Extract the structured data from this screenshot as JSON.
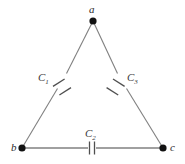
{
  "figure": {
    "type": "circuit-diagram",
    "background_color": "#ffffff",
    "wire_color": "#808080",
    "node_color": "#111111",
    "plate_color": "#5a5a5a",
    "label_color": "#2b2b2b"
  },
  "nodes": [
    {
      "id": "a",
      "label": "a",
      "x": 93,
      "y": 21
    },
    {
      "id": "b",
      "label": "b",
      "x": 22,
      "y": 148
    },
    {
      "id": "c",
      "label": "c",
      "x": 163,
      "y": 148
    }
  ],
  "components": [
    {
      "id": "C1",
      "label": "C",
      "subscript": "1",
      "edge": "b-a",
      "x": 62,
      "y": 82
    },
    {
      "id": "C2",
      "label": "C",
      "subscript": "2",
      "edge": "b-c",
      "x": 92,
      "y": 148
    },
    {
      "id": "C3",
      "label": "C",
      "subscript": "3",
      "edge": "a-c",
      "x": 122,
      "y": 82
    }
  ],
  "edges": [
    {
      "id": "edge-ba",
      "from": "b",
      "to": "a"
    },
    {
      "id": "edge-ac",
      "from": "a",
      "to": "c"
    },
    {
      "id": "edge-bc",
      "from": "b",
      "to": "c"
    }
  ]
}
